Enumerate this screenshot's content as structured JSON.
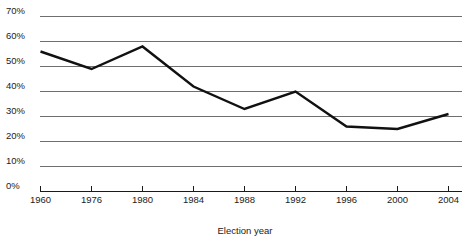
{
  "chart_data": {
    "type": "line",
    "title": "",
    "subtitle": "",
    "xlabel": "Election year",
    "ylabel": "",
    "grid": true,
    "legend": false,
    "categories": [
      "1960",
      "1976",
      "1980",
      "1984",
      "1988",
      "1992",
      "1996",
      "2000",
      "2004"
    ],
    "x": [
      1960,
      1976,
      1980,
      1984,
      1988,
      1992,
      1996,
      2000,
      2004
    ],
    "values": [
      56,
      49,
      58,
      42,
      33,
      40,
      26,
      25,
      31
    ],
    "value_unit": "%",
    "ylim": [
      0,
      70
    ],
    "yticks": [
      0,
      10,
      20,
      30,
      40,
      50,
      60,
      70
    ],
    "ytick_labels": [
      "0%",
      "10%",
      "20%",
      "30%",
      "40%",
      "50%",
      "60%",
      "70%"
    ],
    "xtick_labels": [
      "1960",
      "1976",
      "1980",
      "1984",
      "1988",
      "1992",
      "1996",
      "2000",
      "2004"
    ],
    "series": [
      {
        "name": "",
        "color": "#111111",
        "values": [
          56,
          49,
          58,
          42,
          33,
          40,
          26,
          25,
          31
        ]
      }
    ],
    "colors": {
      "line": "#111111",
      "gridline": "#6f6f6f",
      "axis": "#1a1a1a",
      "text": "#222222",
      "background": "#ffffff"
    }
  },
  "labels": {
    "y0": "0%",
    "y10": "10%",
    "y20": "20%",
    "y30": "30%",
    "y40": "40%",
    "y50": "50%",
    "y60": "60%",
    "y70": "70%",
    "x1960": "1960",
    "x1976": "1976",
    "x1980": "1980",
    "x1984": "1984",
    "x1988": "1988",
    "x1992": "1992",
    "x1996": "1996",
    "x2000": "2000",
    "x2004": "2004",
    "xaxis_title": "Election year"
  }
}
